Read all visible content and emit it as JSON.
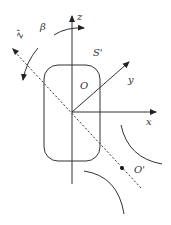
{
  "diagram": {
    "type": "coordinate-frame-schematic",
    "labels": {
      "z_axis": "z",
      "z_prime_axis": "z'",
      "x_axis": "x",
      "y_axis": "y",
      "origin": "O",
      "origin_prime": "O'",
      "frame": "S'",
      "angle": "β"
    },
    "colors": {
      "stroke": "#333333",
      "background": "#ffffff"
    }
  }
}
